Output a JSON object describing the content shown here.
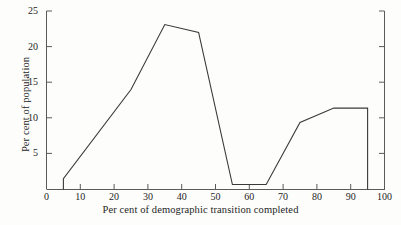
{
  "chart_data": {
    "type": "line",
    "title": "",
    "xlabel": "Per cent of demographic transition completed",
    "ylabel": "Per cent of  population",
    "xlim": [
      0,
      100
    ],
    "ylim": [
      0,
      25
    ],
    "xticks": [
      0,
      10,
      20,
      30,
      40,
      50,
      60,
      70,
      80,
      90,
      100
    ],
    "xtick_labels": [
      "0",
      "10",
      "20",
      "30",
      "40",
      "50",
      "60",
      "70",
      "80",
      "90",
      "100"
    ],
    "yticks": [
      0,
      5,
      10,
      15,
      20,
      25
    ],
    "ytick_labels": [
      "0",
      "5",
      "10",
      "15",
      "20",
      "25"
    ],
    "grid": false,
    "legend": false,
    "line_color": "#3a3a3a",
    "axis_color": "#5a5a5a",
    "background_color": "#fdfdfb",
    "series": [
      {
        "name": "Per cent of population",
        "x": [
          5,
          5,
          25,
          35,
          45,
          55,
          65,
          75,
          85,
          95,
          95
        ],
        "values": [
          0,
          1.5,
          14.0,
          23.1,
          22.0,
          0.7,
          0.7,
          9.4,
          11.4,
          11.4,
          0
        ]
      }
    ]
  },
  "axes": {
    "x_title": "Per cent of demographic transition completed",
    "y_title": "Per cent of  population"
  }
}
